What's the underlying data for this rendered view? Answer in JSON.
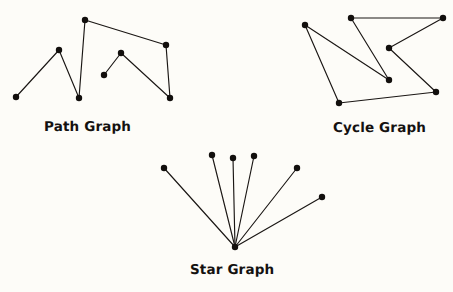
{
  "figure": {
    "width": 453,
    "height": 292,
    "background_color": "#fdfcf8",
    "ink_color": "#120f0d"
  },
  "captions": {
    "path": "Path Graph",
    "cycle": "Cycle Graph",
    "star": "Star Graph"
  },
  "chart_data": {
    "type": "diagram",
    "subtype": "node-link-graphs",
    "background": "#fdfcf8",
    "stroke": "#1a1614",
    "vertex_radius": 3.2,
    "graphs": [
      {
        "name": "Path Graph",
        "label": "Path Graph",
        "label_position": {
          "x": 44,
          "y": 119
        },
        "vertex_count": 8,
        "edge_count": 7,
        "vertices": [
          {
            "id": "p0",
            "x": 16,
            "y": 97
          },
          {
            "id": "p1",
            "x": 59,
            "y": 50
          },
          {
            "id": "p2",
            "x": 79,
            "y": 98
          },
          {
            "id": "p3",
            "x": 85,
            "y": 20
          },
          {
            "id": "p4",
            "x": 166,
            "y": 45
          },
          {
            "id": "p5",
            "x": 170,
            "y": 98
          },
          {
            "id": "p6",
            "x": 121,
            "y": 53
          },
          {
            "id": "p7",
            "x": 104,
            "y": 75
          }
        ],
        "edges": [
          [
            "p0",
            "p1"
          ],
          [
            "p1",
            "p2"
          ],
          [
            "p2",
            "p3"
          ],
          [
            "p3",
            "p4"
          ],
          [
            "p4",
            "p5"
          ],
          [
            "p5",
            "p6"
          ],
          [
            "p6",
            "p7"
          ]
        ]
      },
      {
        "name": "Cycle Graph",
        "label": "Cycle Graph",
        "label_position": {
          "x": 333,
          "y": 120
        },
        "vertex_count": 7,
        "edge_count": 7,
        "vertices": [
          {
            "id": "c0",
            "x": 305,
            "y": 25
          },
          {
            "id": "c1",
            "x": 351,
            "y": 18
          },
          {
            "id": "c2",
            "x": 443,
            "y": 18
          },
          {
            "id": "c3",
            "x": 389,
            "y": 48
          },
          {
            "id": "c4",
            "x": 436,
            "y": 92
          },
          {
            "id": "c5",
            "x": 339,
            "y": 103
          },
          {
            "id": "c6",
            "x": 389,
            "y": 80
          }
        ],
        "edges": [
          [
            "c0",
            "c6"
          ],
          [
            "c6",
            "c1"
          ],
          [
            "c1",
            "c2"
          ],
          [
            "c2",
            "c3"
          ],
          [
            "c3",
            "c4"
          ],
          [
            "c4",
            "c5"
          ],
          [
            "c5",
            "c0"
          ]
        ]
      },
      {
        "name": "Star Graph",
        "label": "Star Graph",
        "label_position": {
          "x": 190,
          "y": 262
        },
        "vertex_count": 7,
        "edge_count": 6,
        "center": {
          "id": "s0",
          "x": 235,
          "y": 247
        },
        "vertices": [
          {
            "id": "s0",
            "x": 235,
            "y": 247
          },
          {
            "id": "s1",
            "x": 164,
            "y": 168
          },
          {
            "id": "s2",
            "x": 212,
            "y": 155
          },
          {
            "id": "s3",
            "x": 233,
            "y": 158
          },
          {
            "id": "s4",
            "x": 254,
            "y": 156
          },
          {
            "id": "s5",
            "x": 297,
            "y": 168
          },
          {
            "id": "s6",
            "x": 322,
            "y": 197
          }
        ],
        "edges": [
          [
            "s0",
            "s1"
          ],
          [
            "s0",
            "s2"
          ],
          [
            "s0",
            "s3"
          ],
          [
            "s0",
            "s4"
          ],
          [
            "s0",
            "s5"
          ],
          [
            "s0",
            "s6"
          ]
        ]
      }
    ]
  }
}
